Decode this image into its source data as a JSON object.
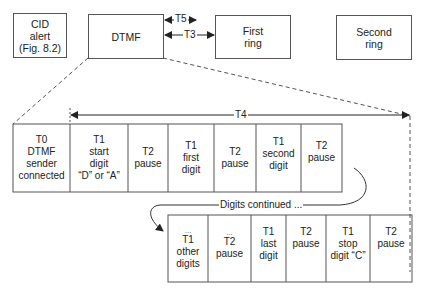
{
  "top_boxes": {
    "cid": {
      "line1": "CID",
      "line2": "alert",
      "line3": "(Fig. 8.2)"
    },
    "dtmf": {
      "label": "DTMF"
    },
    "first_ring": {
      "line1": "First",
      "line2": "ring"
    },
    "second_ring": {
      "line1": "Second",
      "line2": "ring"
    }
  },
  "timers": {
    "t5": "T5",
    "t3": "T3",
    "t4": "T4"
  },
  "row1": [
    {
      "l1": "T0",
      "l2": "DTMF",
      "l3": "sender",
      "l4": "connected"
    },
    {
      "l1": "T1",
      "l2": "start",
      "l3": "digit",
      "l4": "“D” or “A”"
    },
    {
      "l1": "T2",
      "l2": "pause"
    },
    {
      "l1": "T1",
      "l2": "first",
      "l3": "digit"
    },
    {
      "l1": "T2",
      "l2": "pause"
    },
    {
      "l1": "T1",
      "l2": "second",
      "l3": "digit"
    },
    {
      "l1": "T2",
      "l2": "pause"
    }
  ],
  "continuation": {
    "label": "Digits continued ..."
  },
  "row2": [
    {
      "dots": "...",
      "l1": "T1",
      "l2": "other",
      "l3": "digits"
    },
    {
      "dots": "...",
      "l1": "T2",
      "l2": "pause"
    },
    {
      "l1": "T1",
      "l2": "last",
      "l3": "digit"
    },
    {
      "l1": "T2",
      "l2": "pause"
    },
    {
      "l1": "T1",
      "l2": "stop",
      "l3": "digit “C”"
    },
    {
      "l1": "T2",
      "l2": "pause"
    }
  ],
  "colors": {
    "line": "#444444",
    "background": "#ffffff"
  }
}
